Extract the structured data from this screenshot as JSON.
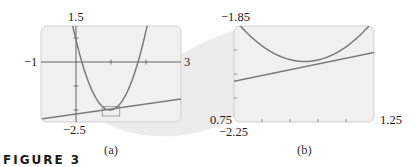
{
  "figure": {
    "label": "FIGURE 3",
    "colors": {
      "panel_bg": "#f0f0f0",
      "panel_border": "#cfcfcf",
      "curve": "#7a7a7a",
      "axis": "#555555",
      "callout": "#e6e6e6"
    }
  },
  "chart_data": [
    {
      "type": "line",
      "caption": "(a)",
      "xlim": [
        -1,
        3
      ],
      "ylim": [
        -2.5,
        1.5
      ],
      "tick_labels": {
        "x_min": "−1",
        "x_max": "3",
        "y_max": "1.5",
        "y_min": "−2.5"
      },
      "x_ticks": [
        0,
        1,
        2
      ],
      "y_ticks": [
        1,
        -1,
        -2
      ],
      "grid": false,
      "series": [
        {
          "name": "parabola",
          "kind": "curve",
          "x": [
            -0.08,
            0.17,
            0.5,
            0.97,
            1.4,
            1.77,
            2.0
          ],
          "y": [
            1.42,
            0.0,
            -1.32,
            -2.0,
            -1.43,
            0.0,
            1.29
          ]
        },
        {
          "name": "line",
          "kind": "line",
          "x": [
            -1,
            3
          ],
          "y": [
            -2.38,
            -1.54
          ]
        }
      ],
      "annotations": [
        {
          "type": "zoom-rectangle",
          "x": [
            0.75,
            1.25
          ],
          "y": [
            -2.25,
            -1.85
          ]
        }
      ]
    },
    {
      "type": "line",
      "caption": "(b)",
      "xlim": [
        0.75,
        1.25
      ],
      "ylim": [
        -2.25,
        -1.85
      ],
      "tick_labels": {
        "x_min": "0.75",
        "x_max": "1.25",
        "y_max": "−1.85",
        "y_min": "−2.25"
      },
      "grid": false,
      "series": [
        {
          "name": "parabola",
          "kind": "curve",
          "x": [
            0.77,
            0.85,
            0.95,
            1.03,
            1.1,
            1.18,
            1.22
          ],
          "y": [
            -1.85,
            -1.93,
            -1.98,
            -2.0,
            -1.98,
            -1.91,
            -1.86
          ]
        },
        {
          "name": "line",
          "kind": "line",
          "x": [
            0.75,
            1.25
          ],
          "y": [
            -2.08,
            -1.96
          ]
        }
      ]
    }
  ]
}
